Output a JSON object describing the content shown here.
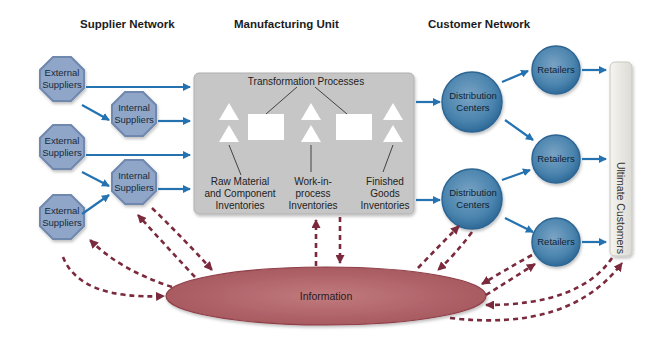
{
  "sections": {
    "supplier": "Supplier Network",
    "manufacturing": "Manufacturing Unit",
    "customer": "Customer Network"
  },
  "suppliers": [
    {
      "type": "External",
      "line1": "External",
      "line2": "Suppliers"
    },
    {
      "type": "Internal",
      "line1": "Internal",
      "line2": "Suppliers"
    },
    {
      "type": "External",
      "line1": "External",
      "line2": "Suppliers"
    },
    {
      "type": "Internal",
      "line1": "Internal",
      "line2": "Suppliers"
    },
    {
      "type": "External",
      "line1": "External",
      "line2": "Suppliers"
    }
  ],
  "manufacturing_unit": {
    "transformation_label": "Transformation Processes",
    "inventories": [
      {
        "line1": "Raw Material",
        "line2": "and Component",
        "line3": "Inventories"
      },
      {
        "line1": "Work-in-",
        "line2": "process",
        "line3": "Inventories"
      },
      {
        "line1": "Finished",
        "line2": "Goods",
        "line3": "Inventories"
      }
    ]
  },
  "distribution_centers": [
    {
      "line1": "Distribution",
      "line2": "Centers"
    },
    {
      "line1": "Distribution",
      "line2": "Centers"
    }
  ],
  "retailers": [
    {
      "label": "Retailers"
    },
    {
      "label": "Retailers"
    },
    {
      "label": "Retailers"
    }
  ],
  "ultimate_customers": "Ultimate Customers",
  "information": "Information",
  "colors": {
    "supplier_fill": "#8fa6c8",
    "supplier_stroke": "#6f88ae",
    "flow_arrow": "#2472b0",
    "manufacturing_fill": "#c6c6c6",
    "customer_circle": "#3f7aa6",
    "info_fill": "#b5676c",
    "info_arrow": "#7a2a3c",
    "customer_bar": "#ecebe6"
  }
}
